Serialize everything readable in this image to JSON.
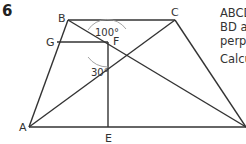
{
  "question": {
    "number": "6",
    "text_lines": [
      "ABCD",
      "BD a",
      "perp",
      "Calcu"
    ]
  },
  "diagram": {
    "points": {
      "A": {
        "label": "A",
        "x": 29,
        "y": 127
      },
      "B": {
        "label": "B",
        "x": 68,
        "y": 20
      },
      "C": {
        "label": "C",
        "x": 175,
        "y": 20
      },
      "D": {
        "label": "D",
        "x": 246,
        "y": 127
      },
      "E": {
        "label": "E",
        "x": 109,
        "y": 127
      },
      "F": {
        "label": "F",
        "x": 108,
        "y": 42
      },
      "G": {
        "label": "G",
        "x": 57,
        "y": 42
      }
    },
    "angles": {
      "top": "100°",
      "lower": "30°"
    },
    "colors": {
      "line": "#333333",
      "arc": "#999999"
    }
  }
}
